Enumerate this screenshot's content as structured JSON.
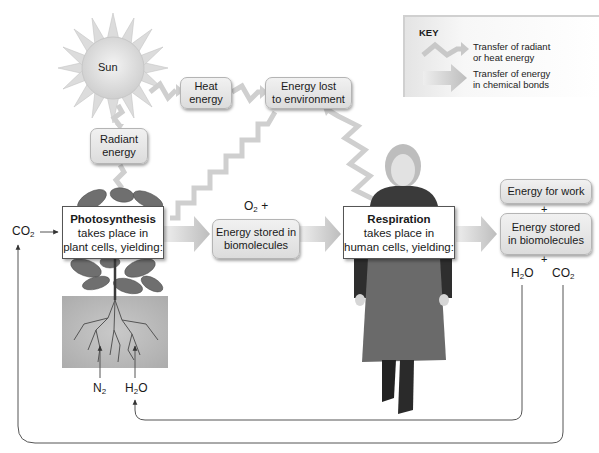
{
  "key": {
    "title": "KEY",
    "items": [
      {
        "icon": "zigzag-arrow",
        "label_line1": "Transfer of radiant",
        "label_line2": "or heat energy"
      },
      {
        "icon": "block-arrow",
        "label_line1": "Transfer of energy",
        "label_line2": "in chemical bonds"
      }
    ]
  },
  "sun": {
    "label": "Sun"
  },
  "boxes": {
    "heat_energy": {
      "line1": "Heat",
      "line2": "energy"
    },
    "energy_lost": {
      "line1": "Energy lost",
      "line2": "to environment"
    },
    "radiant_energy": {
      "line1": "Radiant",
      "line2": "energy"
    },
    "energy_stored_mid": {
      "line1": "Energy stored in",
      "line2": "biomolecules"
    },
    "energy_for_work": {
      "line1": "Energy for work"
    },
    "energy_stored_right": {
      "line1": "Energy stored",
      "line2": "in biomolecules"
    }
  },
  "processes": {
    "photosynthesis": {
      "title": "Photosynthesis",
      "line2": "takes place in",
      "line3": "plant cells, yielding:"
    },
    "respiration": {
      "title": "Respiration",
      "line2": "takes place in",
      "line3": "human cells, yielding:"
    }
  },
  "chemicals": {
    "co2_left": {
      "base": "CO",
      "sub": "2"
    },
    "o2": {
      "base": "O",
      "sub": "2",
      "suffix": " +"
    },
    "h2o_right": {
      "base1": "H",
      "sub": "2",
      "base2": "O"
    },
    "co2_right": {
      "base": "CO",
      "sub": "2"
    },
    "n2": {
      "base": "N",
      "sub": "2"
    },
    "h2o_bottom": {
      "base1": "H",
      "sub": "2",
      "base2": "O"
    }
  },
  "plus_signs": {
    "p1": "+",
    "p2": "+"
  },
  "colors": {
    "arrow_gray": "#c8c8c8",
    "box_fill": "#e6e6e6",
    "soil": "#b8b8b8",
    "line": "#555555"
  }
}
